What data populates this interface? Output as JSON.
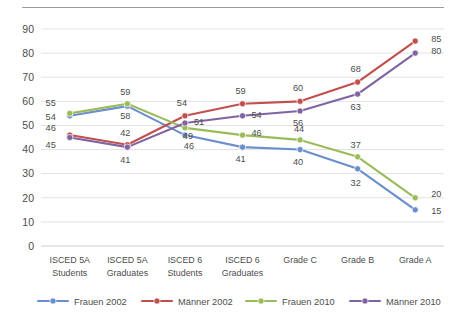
{
  "chart_data": {
    "type": "line",
    "title": "",
    "subtitle": "",
    "xlabel": "",
    "ylabel": "",
    "ylim": [
      0,
      90
    ],
    "ytick_step": 10,
    "yticks": [
      0,
      10,
      20,
      30,
      40,
      50,
      60,
      70,
      80,
      90
    ],
    "grid": true,
    "legend_position": "bottom",
    "data_labels": true,
    "categories": [
      "ISCED 5A Students",
      "ISCED 5A Graduates",
      "ISCED 6 Students",
      "ISCED 6 Graduates",
      "Grade C",
      "Grade B",
      "Grade A"
    ],
    "categories_lines": [
      [
        "ISCED 5A",
        "Students"
      ],
      [
        "ISCED 5A",
        "Graduates"
      ],
      [
        "ISCED 6",
        "Students"
      ],
      [
        "ISCED 6",
        "Graduates"
      ],
      [
        "Grade C",
        ""
      ],
      [
        "Grade B",
        ""
      ],
      [
        "Grade A",
        ""
      ]
    ],
    "series": [
      {
        "name": "Frauen 2002",
        "color": "#6B8FCE",
        "values": [
          54,
          58,
          46,
          41,
          40,
          32,
          15
        ],
        "label_offsets": [
          {
            "dx": -14,
            "dy": 4
          },
          {
            "dx": -2,
            "dy": 13
          },
          {
            "dx": 4,
            "dy": 14
          },
          {
            "dx": -2,
            "dy": 15
          },
          {
            "dx": -2,
            "dy": 15
          },
          {
            "dx": -2,
            "dy": 17
          },
          {
            "dx": 16,
            "dy": 4
          }
        ]
      },
      {
        "name": "Männer 2002",
        "color": "#C0504D",
        "values": [
          46,
          42,
          54,
          59,
          60,
          68,
          85
        ],
        "label_offsets": [
          {
            "dx": -14,
            "dy": -4
          },
          {
            "dx": -2,
            "dy": -9
          },
          {
            "dx": -3,
            "dy": -10
          },
          {
            "dx": -2,
            "dy": -10
          },
          {
            "dx": -2,
            "dy": -10
          },
          {
            "dx": -2,
            "dy": -10
          },
          {
            "dx": 16,
            "dy": 1
          }
        ]
      },
      {
        "name": "Frauen 2010",
        "color": "#9BBB59",
        "values": [
          55,
          59,
          49,
          46,
          44,
          37,
          20
        ],
        "label_offsets": [
          {
            "dx": -14,
            "dy": -7
          },
          {
            "dx": -2,
            "dy": -9
          },
          {
            "dx": 3,
            "dy": 11
          },
          {
            "dx": 9,
            "dy": 1
          },
          {
            "dx": -1,
            "dy": -8
          },
          {
            "dx": -2,
            "dy": -9
          },
          {
            "dx": 16,
            "dy": -1
          }
        ]
      },
      {
        "name": "Männer 2010",
        "color": "#8064A2",
        "values": [
          45,
          41,
          51,
          54,
          56,
          63,
          80
        ],
        "label_offsets": [
          {
            "dx": -14,
            "dy": 10
          },
          {
            "dx": -2,
            "dy": 16
          },
          {
            "dx": 9,
            "dy": 2
          },
          {
            "dx": 9,
            "dy": 2
          },
          {
            "dx": -2,
            "dy": 15
          },
          {
            "dx": -2,
            "dy": 16
          },
          {
            "dx": 16,
            "dy": 1
          }
        ]
      }
    ]
  },
  "legend": {
    "items": [
      {
        "label": "Frauen 2002",
        "color": "#6B8FCE"
      },
      {
        "label": "Männer 2002",
        "color": "#C0504D"
      },
      {
        "label": "Frauen 2010",
        "color": "#9BBB59"
      },
      {
        "label": "Männer 2010",
        "color": "#8064A2"
      }
    ]
  },
  "colors": {
    "grid": "#e2e2e2",
    "axis": "#cfcfcf",
    "text": "#4d4d4d",
    "background": "#ffffff",
    "top_rule": "#9a9a9a"
  }
}
